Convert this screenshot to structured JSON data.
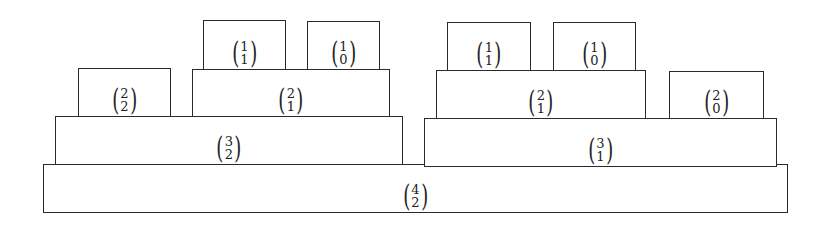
{
  "diagram": {
    "title": "",
    "boxes": [
      {
        "id": "b42",
        "n": "4",
        "k": "2",
        "x": 43,
        "y": 164,
        "w": 745,
        "h": 49
      },
      {
        "id": "b32",
        "n": "3",
        "k": "2",
        "x": 55,
        "y": 116,
        "w": 348,
        "h": 49
      },
      {
        "id": "b31",
        "n": "3",
        "k": "1",
        "x": 424,
        "y": 118,
        "w": 353,
        "h": 49
      },
      {
        "id": "b22",
        "n": "2",
        "k": "2",
        "x": 78,
        "y": 68,
        "w": 93,
        "h": 49
      },
      {
        "id": "b21L",
        "n": "2",
        "k": "1",
        "x": 192,
        "y": 69,
        "w": 198,
        "h": 48
      },
      {
        "id": "b21R",
        "n": "2",
        "k": "1",
        "x": 436,
        "y": 70,
        "w": 210,
        "h": 49
      },
      {
        "id": "b20",
        "n": "2",
        "k": "0",
        "x": 669,
        "y": 71,
        "w": 95,
        "h": 48
      },
      {
        "id": "b11L",
        "n": "1",
        "k": "1",
        "x": 203,
        "y": 20,
        "w": 83,
        "h": 50
      },
      {
        "id": "b10L",
        "n": "1",
        "k": "0",
        "x": 307,
        "y": 21,
        "w": 73,
        "h": 49
      },
      {
        "id": "b11R",
        "n": "1",
        "k": "1",
        "x": 447,
        "y": 22,
        "w": 84,
        "h": 49
      },
      {
        "id": "b10R",
        "n": "1",
        "k": "0",
        "x": 553,
        "y": 22,
        "w": 83,
        "h": 49
      }
    ],
    "colors": {
      "stroke": "#2a2a2a",
      "fill": "#ffffff",
      "text": "#222222"
    }
  }
}
